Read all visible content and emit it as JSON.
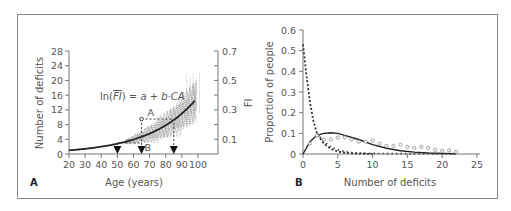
{
  "chart_data": [
    {
      "panel": "A",
      "type": "line",
      "xlabel": "Age (years)",
      "ylabel": "Number of deficits",
      "y2label": "FI",
      "x_ticks": [
        20,
        30,
        40,
        50,
        60,
        70,
        80,
        90,
        100
      ],
      "y_ticks": [
        0,
        4,
        8,
        12,
        16,
        20,
        24,
        28
      ],
      "y2_ticks": [
        0.1,
        0.3,
        0.5,
        0.7
      ],
      "xlim": [
        20,
        100
      ],
      "ylim": [
        0,
        28
      ],
      "y2lim": [
        0,
        0.7
      ],
      "equation": "ln(FI) = a + b·CA",
      "annotations": [
        {
          "label": "A",
          "x": 65,
          "y": 9.5
        },
        {
          "label": "B",
          "x": 65,
          "y": 3
        }
      ],
      "arrows_at_age": [
        50,
        65,
        85
      ],
      "series": [
        {
          "name": "exponential fit",
          "x": [
            20,
            30,
            40,
            50,
            60,
            70,
            80,
            90,
            100
          ],
          "y": [
            1.0,
            1.4,
            2.0,
            2.8,
            3.9,
            5.5,
            7.8,
            11.0,
            15.5
          ]
        }
      ]
    },
    {
      "panel": "B",
      "type": "line",
      "xlabel": "Number of deficits",
      "ylabel": "Proportion of people",
      "x_ticks": [
        0,
        5,
        10,
        15,
        20,
        25
      ],
      "y_ticks": [
        0,
        0.1,
        0.2,
        0.3,
        0.4,
        0.5,
        0.6
      ],
      "xlim": [
        0,
        25
      ],
      "ylim": [
        0,
        0.6
      ],
      "series": [
        {
          "name": "solid curve",
          "style": "solid",
          "x": [
            0,
            1,
            2,
            3,
            4,
            5,
            6,
            8,
            10,
            12,
            14,
            16,
            18,
            20,
            22
          ],
          "y": [
            0,
            0.06,
            0.09,
            0.1,
            0.103,
            0.1,
            0.09,
            0.07,
            0.045,
            0.028,
            0.016,
            0.009,
            0.005,
            0.003,
            0.001
          ]
        },
        {
          "name": "dashed steep curve",
          "style": "dashed",
          "x": [
            0,
            0.5,
            1,
            1.5,
            2,
            3,
            4,
            5,
            6,
            8,
            10
          ],
          "y": [
            0.53,
            0.38,
            0.25,
            0.16,
            0.1,
            0.05,
            0.025,
            0.012,
            0.006,
            0.002,
            0
          ]
        },
        {
          "name": "dotted curve",
          "style": "dotted",
          "x": [
            2,
            3,
            4,
            5,
            6,
            7,
            8,
            10,
            12,
            14,
            16,
            18,
            20,
            22
          ],
          "y": [
            0.1,
            0.06,
            0.035,
            0.02,
            0.012,
            0.007,
            0.005,
            0.003,
            0.002,
            0.002,
            0.001,
            0.001,
            0,
            0
          ]
        },
        {
          "name": "observed",
          "style": "circles",
          "x": [
            1,
            2,
            3,
            4,
            5,
            6,
            7,
            8,
            9,
            10,
            11,
            12,
            13,
            14,
            15,
            16,
            17,
            18,
            19,
            20,
            21,
            22
          ],
          "y": [
            0.05,
            0.09,
            0.07,
            0.07,
            0.08,
            0.08,
            0.07,
            0.06,
            0.06,
            0.065,
            0.05,
            0.04,
            0.04,
            0.045,
            0.035,
            0.03,
            0.035,
            0.03,
            0.02,
            0.015,
            0.018,
            0.01
          ]
        }
      ]
    }
  ],
  "panel_labels": {
    "a": "A",
    "b": "B"
  }
}
